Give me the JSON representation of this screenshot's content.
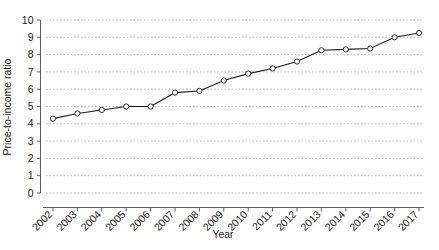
{
  "chart_data": {
    "type": "line",
    "title": "",
    "xlabel": "Year",
    "ylabel": "Price-to-income ratio",
    "categories": [
      "2002",
      "2003",
      "2004",
      "2005",
      "2006",
      "2007",
      "2008",
      "2009",
      "2010",
      "2011",
      "2012",
      "2013",
      "2014",
      "2015",
      "2016",
      "2017"
    ],
    "values": [
      4.3,
      4.6,
      4.8,
      5.0,
      5.0,
      5.8,
      5.9,
      6.5,
      6.9,
      7.2,
      7.6,
      8.25,
      8.3,
      8.35,
      9.0,
      9.25
    ],
    "series": [
      {
        "name": "Price-to-income ratio",
        "values": [
          4.3,
          4.6,
          4.8,
          5.0,
          5.0,
          5.8,
          5.9,
          6.5,
          6.9,
          7.2,
          7.6,
          8.25,
          8.3,
          8.35,
          9.0,
          9.25
        ]
      }
    ],
    "ylim": [
      0,
      10
    ],
    "ytick_labels": [
      "0",
      "1",
      "2",
      "3",
      "4",
      "5",
      "6",
      "7",
      "8",
      "9",
      "10"
    ],
    "ytick_values": [
      0,
      1,
      2,
      3,
      4,
      5,
      6,
      7,
      8,
      9,
      10
    ],
    "xtick_labels": [
      "2002",
      "2003",
      "2004",
      "2005",
      "2006",
      "2007",
      "2008",
      "2009",
      "2010",
      "2011",
      "2012",
      "2013",
      "2014",
      "2015",
      "2016",
      "2017"
    ],
    "grid": "horizontal-dotted",
    "legend": "none",
    "marker": "open-circle",
    "line_color": "#1a1a1a",
    "marker_fill": "#ffffff",
    "grid_color": "#9a9a9a",
    "axis_color": "#4d4d4d",
    "background_color": "#ffffff",
    "xtick_label_rotation": 45
  }
}
